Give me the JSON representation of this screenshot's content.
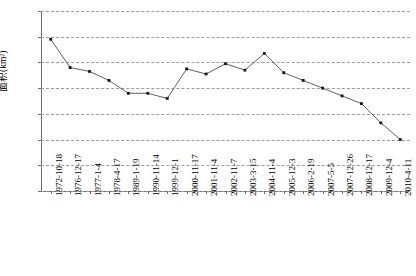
{
  "chart_data": {
    "type": "line",
    "title": "",
    "xlabel": "",
    "ylabel": "面积(km²)",
    "ylim": [
      560,
      700
    ],
    "ytick_step": 20,
    "yticks": [
      560,
      580,
      600,
      620,
      640,
      660,
      680,
      700
    ],
    "grid": true,
    "legend": "none",
    "marker": "filled-square",
    "line_color": "#4d4d4d",
    "marker_color": "#111111",
    "grid_color": "#9a9a9a",
    "axis_color": "#6b6b6b",
    "categories": [
      "1972-10-18",
      "1976-12-17",
      "1977-1-4",
      "1978-4-17",
      "1989-1-19",
      "1990-11-14",
      "1999-12-1",
      "2000-11-17",
      "2001-11-4",
      "2002-11-7",
      "2003-3-15",
      "2004-11-4",
      "2005-12-3",
      "2006-2-19",
      "2007-5-5",
      "2007-12-26",
      "2008-12-17",
      "2009-12-4",
      "2010-4-11"
    ],
    "values": [
      678,
      656,
      653,
      646,
      636,
      636,
      632,
      655,
      651,
      659,
      654,
      667,
      652,
      646,
      640,
      634,
      628,
      613,
      600
    ]
  }
}
